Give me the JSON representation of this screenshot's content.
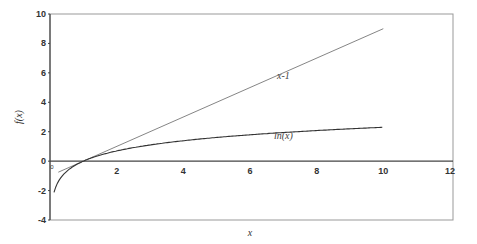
{
  "chart_data": {
    "type": "line",
    "title": "",
    "xlabel": "x",
    "ylabel": "f(x)",
    "xlim": [
      0,
      12
    ],
    "ylim": [
      -4,
      10
    ],
    "grid": false,
    "legend": "none (inline curve labels)",
    "x_ticks": [
      "0",
      "2",
      "4",
      "6",
      "8",
      "10",
      "12"
    ],
    "y_ticks": [
      "-4",
      "-2",
      "0",
      "2",
      "4",
      "6",
      "8",
      "10"
    ],
    "series": [
      {
        "name": "x-1",
        "label_text": "x-1",
        "x": [
          0.25,
          10
        ],
        "values": [
          -0.75,
          9
        ]
      },
      {
        "name": "ln(x)",
        "label_text": "ln(x)",
        "x": [
          0.12,
          0.25,
          0.5,
          1,
          2,
          3,
          4,
          5,
          6,
          7,
          8,
          9,
          10
        ],
        "values": [
          -2.12,
          -1.39,
          -0.69,
          0,
          0.69,
          1.1,
          1.39,
          1.61,
          1.79,
          1.95,
          2.08,
          2.2,
          2.3
        ]
      }
    ],
    "annotations": [
      {
        "text": "x-1",
        "x": 7.0,
        "y": 5.6
      },
      {
        "text": "ln(x)",
        "x": 7.0,
        "y": 1.5
      }
    ],
    "colors": {
      "axis": "#444444",
      "frame": "#999999",
      "line_x_minus_1": "#777777",
      "line_ln": "#333333"
    }
  }
}
